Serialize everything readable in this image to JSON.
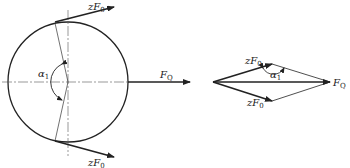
{
  "diagram": {
    "left": {
      "top_force_label": "zF",
      "top_force_sub": "0",
      "bottom_force_label": "zF",
      "bottom_force_sub": "0",
      "resultant_label": "F",
      "resultant_sub": "Q",
      "angle_label": "α",
      "angle_sub": "1"
    },
    "right": {
      "top_force_label": "zF",
      "top_force_sub": "0",
      "bottom_force_label": "zF",
      "bottom_force_sub": "0",
      "resultant_label": "F",
      "resultant_sub": "Q",
      "angle_label": "α",
      "angle_sub": "1"
    },
    "colors": {
      "line": "#222222",
      "background": "#ffffff"
    }
  }
}
